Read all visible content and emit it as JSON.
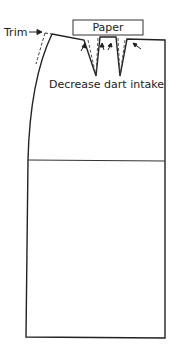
{
  "diagram": {
    "type": "sewing-pattern-skirt-front",
    "labels": {
      "trim": "Trim",
      "paper": "Paper",
      "decrease_dart": "Decrease dart intake"
    },
    "colors": {
      "line": "#222222",
      "background": "#ffffff"
    }
  }
}
